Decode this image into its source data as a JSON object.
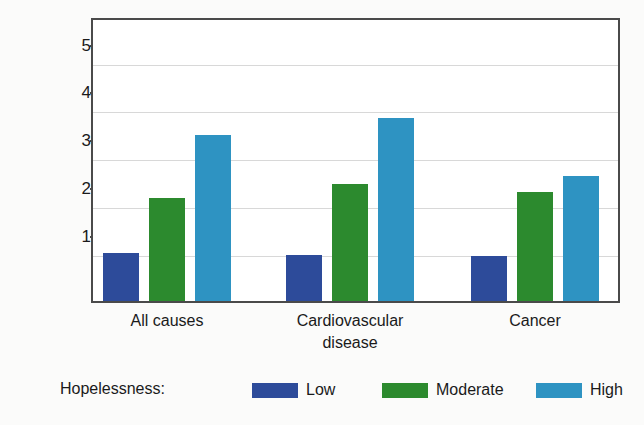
{
  "chart_data": {
    "type": "bar",
    "title": "",
    "subtitle": "",
    "xlabel": "",
    "ylabel": "Mortality Rate",
    "categories": [
      "All causes",
      "Cardiovascular disease",
      "Cancer"
    ],
    "category_lines": [
      [
        "All causes"
      ],
      [
        "Cardiovascular",
        "disease"
      ],
      [
        "Cancer"
      ]
    ],
    "series": [
      {
        "name": "Low",
        "color": "#2d4b9a",
        "values": [
          1.0,
          0.97,
          0.94
        ]
      },
      {
        "name": "Moderate",
        "color": "#2c8a2e",
        "values": [
          2.16,
          2.45,
          2.28
        ]
      },
      {
        "name": "High",
        "color": "#2e93c2",
        "values": [
          3.47,
          3.82,
          2.6
        ]
      }
    ],
    "ylim": [
      0,
      5.95
    ],
    "yticks": [
      1,
      2,
      3,
      4,
      5
    ],
    "ytick_labels": [
      "1",
      "2",
      "3",
      "4",
      "5"
    ],
    "grid": "horizontal",
    "legend_position": "bottom",
    "legend_title": "Hopelessness:"
  },
  "axis": {
    "y_title": "Mortality Rate",
    "tick_labels": [
      "5",
      "4",
      "3",
      "2",
      "1"
    ]
  },
  "legend": {
    "title": "Hopelessness:",
    "items": [
      {
        "label": "Low",
        "color": "#2d4b9a"
      },
      {
        "label": "Moderate",
        "color": "#2c8a2e"
      },
      {
        "label": "High",
        "color": "#2e93c2"
      }
    ]
  },
  "colors": {
    "low": "#2d4b9a",
    "moderate": "#2c8a2e",
    "high": "#2e93c2",
    "frame": "#4a4a4a",
    "grid": "#d8d8d8",
    "background": "#fbfbfa",
    "text": "#1a1a1a"
  }
}
